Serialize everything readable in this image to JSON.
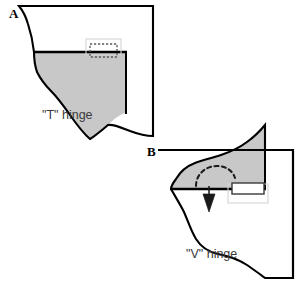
{
  "figure": {
    "type": "diagram",
    "title_visible": false,
    "background_color": "#ffffff",
    "width": 303,
    "height": 284,
    "shape_fill_color": "#c8c8c8",
    "outline_color": "#000000",
    "caption_color": "#3a3a3a",
    "light_box_color": "#d9d9d9"
  },
  "panels": [
    {
      "id": "panel-a",
      "letter": "A",
      "caption": "\"T\" hinge",
      "description_visible_elements": {
        "has_gray_region": true,
        "has_dashed_rectangle": true,
        "has_light_outer_rectangle": true,
        "has_arrow": false,
        "has_dashed_arc": false
      }
    },
    {
      "id": "panel-b",
      "letter": "B",
      "caption": "\"V\" hinge",
      "description_visible_elements": {
        "has_gray_region": true,
        "has_dashed_rectangle": false,
        "has_solid_rectangle": true,
        "has_light_outer_rectangle": true,
        "has_arrow": true,
        "has_dashed_arc": true
      }
    }
  ],
  "annotations": {
    "arrow_direction": "down",
    "arc_style": "dashed-curved"
  }
}
